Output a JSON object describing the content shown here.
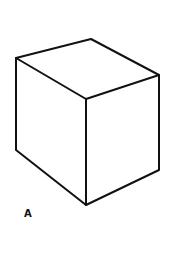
{
  "figure": {
    "label": "A",
    "stroke_color": "#111111",
    "background": "#ffffff",
    "vertices": {
      "top_left": [
        16,
        58
      ],
      "top_back": [
        91,
        39
      ],
      "top_right": [
        159,
        75
      ],
      "front_top": [
        86,
        99
      ],
      "front_bottom": [
        86,
        205
      ],
      "bottom_left": [
        16,
        150
      ],
      "bottom_right": [
        159,
        170
      ]
    }
  }
}
